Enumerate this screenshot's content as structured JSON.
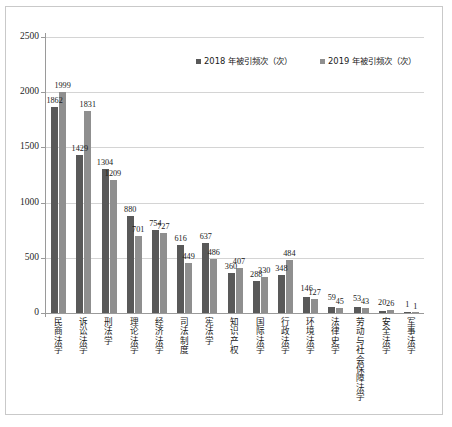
{
  "chart_data": {
    "type": "bar",
    "title": "",
    "subtitle": "",
    "xlabel": "",
    "ylabel": "",
    "ylim": [
      0,
      2500
    ],
    "yticks": [
      "0",
      "500",
      "1000",
      "1500",
      "2000",
      "2500"
    ],
    "ytick_values": [
      0,
      500,
      1000,
      1500,
      2000,
      2500
    ],
    "grid": true,
    "legend_position": "top-center",
    "orientation": "vertical-grouped",
    "categories": [
      "民商法学",
      "诉讼法学",
      "刑法学",
      "理论法学",
      "经济法学",
      "司法制度",
      "宪法学",
      "知识产权",
      "国际法学",
      "行政法学",
      "环境法学",
      "法律史学",
      "劳动与社会保障法学",
      "安全法学",
      "军事法学"
    ],
    "series": [
      {
        "name": "2018 年被引频次（次）",
        "color": "#595959",
        "values": [
          1862,
          1429,
          1304,
          880,
          754,
          616,
          637,
          360,
          288,
          348,
          146,
          59,
          53,
          20,
          1
        ]
      },
      {
        "name": "2019 年被引频次（次）",
        "color": "#8f8f8f",
        "values": [
          1999,
          1831,
          1209,
          701,
          727,
          449,
          486,
          407,
          330,
          484,
          127,
          45,
          43,
          26,
          1
        ]
      }
    ],
    "data_labels": {
      "2018": [
        "1862",
        "1429",
        "1304",
        "880",
        "754",
        "616",
        "637",
        "360",
        "288",
        "348",
        "146",
        "59",
        "53",
        "20",
        "1"
      ],
      "2019": [
        "1999",
        "1831",
        "1209",
        "701",
        "727",
        "449",
        "486",
        "407",
        "330",
        "484",
        "127",
        "45",
        "43",
        "26",
        "1"
      ]
    }
  },
  "legend": {
    "items": [
      {
        "label": "2018 年被引频次（次）"
      },
      {
        "label": "2019 年被引频次（次）"
      }
    ]
  }
}
